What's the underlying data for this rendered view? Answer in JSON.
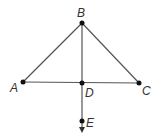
{
  "diagram": {
    "type": "geometry",
    "line_color": "#555555",
    "point_color": "#111111",
    "points": {
      "A": {
        "label": "A",
        "x": 23,
        "y": 82
      },
      "B": {
        "label": "B",
        "x": 82,
        "y": 23
      },
      "C": {
        "label": "C",
        "x": 139,
        "y": 83
      },
      "D": {
        "label": "D",
        "x": 82,
        "y": 83
      },
      "E": {
        "label": "E",
        "x": 81,
        "y": 121
      }
    },
    "segments": [
      {
        "from": "A",
        "to": "B"
      },
      {
        "from": "B",
        "to": "C"
      },
      {
        "from": "A",
        "to": "C"
      },
      {
        "from": "B",
        "to": "D"
      }
    ],
    "rays": [
      {
        "from": "D",
        "through": "E",
        "arrow": "down"
      }
    ]
  }
}
